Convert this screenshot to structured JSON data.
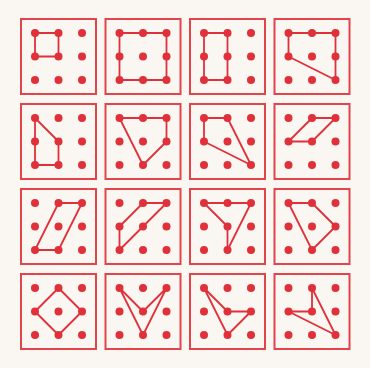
{
  "figure": {
    "colors": {
      "background": "#faf7f3",
      "frame": "#e2444c",
      "dot": "#e0303a",
      "line": "#e0303a"
    },
    "grid": {
      "rows": 4,
      "cols": 4,
      "origin_x": 21,
      "origin_y": 19,
      "panel_size": 75,
      "pitch_x": 84.5,
      "pitch_y": 85,
      "dot_inset": 14,
      "dot_spacing": 23.5,
      "dot_radius": 4
    },
    "panels": [
      {
        "id": 1,
        "polygon": [
          [
            0,
            0
          ],
          [
            1,
            0
          ],
          [
            1,
            1
          ],
          [
            0,
            1
          ]
        ]
      },
      {
        "id": 2,
        "polygon": [
          [
            0,
            0
          ],
          [
            2,
            0
          ],
          [
            2,
            2
          ],
          [
            0,
            2
          ]
        ]
      },
      {
        "id": 3,
        "polygon": [
          [
            0,
            0
          ],
          [
            1,
            0
          ],
          [
            1,
            2
          ],
          [
            0,
            2
          ]
        ]
      },
      {
        "id": 4,
        "polygon": [
          [
            0,
            0
          ],
          [
            2,
            0
          ],
          [
            2,
            2
          ],
          [
            0,
            1
          ]
        ]
      },
      {
        "id": 5,
        "polygon": [
          [
            0,
            0
          ],
          [
            1,
            1
          ],
          [
            1,
            2
          ],
          [
            0,
            2
          ]
        ]
      },
      {
        "id": 6,
        "polygon": [
          [
            0,
            0
          ],
          [
            2,
            0
          ],
          [
            2,
            1
          ],
          [
            1,
            2
          ]
        ]
      },
      {
        "id": 7,
        "polygon": [
          [
            0,
            0
          ],
          [
            1,
            0
          ],
          [
            2,
            2
          ],
          [
            0,
            1
          ]
        ]
      },
      {
        "id": 8,
        "polygon": [
          [
            1,
            0
          ],
          [
            2,
            0
          ],
          [
            1,
            1
          ],
          [
            0,
            1
          ]
        ]
      },
      {
        "id": 9,
        "polygon": [
          [
            1,
            0
          ],
          [
            2,
            0
          ],
          [
            1,
            2
          ],
          [
            0,
            2
          ]
        ]
      },
      {
        "id": 10,
        "polygon": [
          [
            1,
            0
          ],
          [
            2,
            0
          ],
          [
            0,
            2
          ],
          [
            0,
            1
          ]
        ]
      },
      {
        "id": 11,
        "polygon": [
          [
            0,
            0
          ],
          [
            2,
            0
          ],
          [
            1,
            2
          ],
          [
            1,
            1
          ]
        ]
      },
      {
        "id": 12,
        "polygon": [
          [
            0,
            0
          ],
          [
            1,
            0
          ],
          [
            2,
            1
          ],
          [
            1,
            2
          ]
        ]
      },
      {
        "id": 13,
        "polygon": [
          [
            1,
            0
          ],
          [
            2,
            1
          ],
          [
            1,
            2
          ],
          [
            0,
            1
          ]
        ]
      },
      {
        "id": 14,
        "polygon": [
          [
            0,
            0
          ],
          [
            1,
            1
          ],
          [
            2,
            0
          ],
          [
            1,
            2
          ]
        ]
      },
      {
        "id": 15,
        "polygon": [
          [
            0,
            0
          ],
          [
            1,
            1
          ],
          [
            2,
            1
          ],
          [
            1,
            2
          ]
        ]
      },
      {
        "id": 16,
        "polygon": [
          [
            1,
            0
          ],
          [
            2,
            2
          ],
          [
            0,
            1
          ],
          [
            1,
            1
          ]
        ]
      }
    ]
  }
}
